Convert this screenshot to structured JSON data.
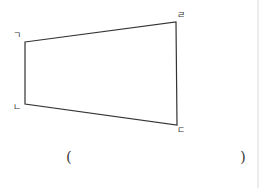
{
  "figure": {
    "shape": "quadrilateral",
    "stroke_color": "#333333",
    "vertices": [
      {
        "name": "ㄱ",
        "x": 25,
        "y": 42
      },
      {
        "name": "ㄹ",
        "x": 176,
        "y": 22
      },
      {
        "name": "ㄷ",
        "x": 177,
        "y": 125
      },
      {
        "name": "ㄴ",
        "x": 25,
        "y": 104
      }
    ],
    "labels": {
      "top_left": "ㄱ",
      "bottom_left": "ㄴ",
      "bottom_right": "ㄷ",
      "top_right": "ㄹ"
    }
  },
  "answer": {
    "open_paren": "(",
    "close_paren": ")",
    "value": ""
  }
}
